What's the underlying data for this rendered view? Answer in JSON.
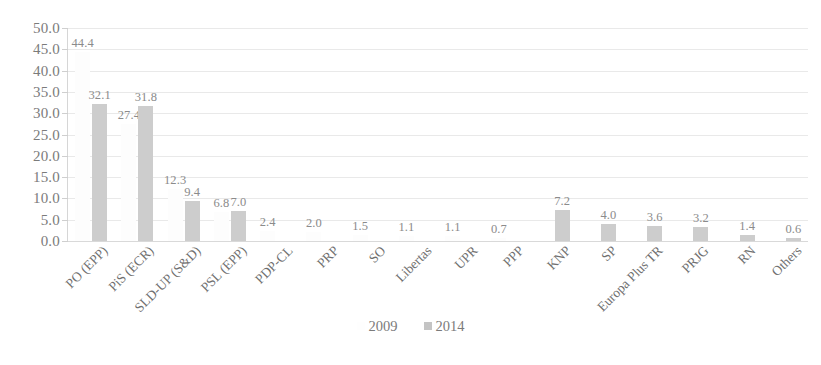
{
  "chart_data": {
    "type": "bar",
    "title": "",
    "subtitle": "",
    "xlabel": "",
    "ylabel": "",
    "ylim": [
      0.0,
      50.0
    ],
    "ytick_step": 5.0,
    "ytick_labels": [
      "50.0",
      "45.0",
      "40.0",
      "35.0",
      "30.0",
      "25.0",
      "20.0",
      "15.0",
      "10.0",
      "5.0",
      "0.0"
    ],
    "grid": true,
    "legend_position": "bottom",
    "categories": [
      "PO (EPP)",
      "PiS (ECR)",
      "SLD-UP (S&D)",
      "PSL (EPP)",
      "PDP-CL",
      "PRP",
      "SO",
      "Libertas",
      "UPR",
      "PPP",
      "KNP",
      "SP",
      "Europa Plus TR",
      "PRJG",
      "RN",
      "Others"
    ],
    "series": [
      {
        "name": "2009",
        "color": "#fdfdfd",
        "values": [
          44.4,
          27.4,
          12.3,
          6.8,
          2.4,
          2.0,
          1.5,
          1.1,
          1.1,
          0.7,
          null,
          null,
          null,
          null,
          null,
          null
        ],
        "labels": [
          "44.4",
          "27.4",
          "12.3",
          "6.8",
          "2.4",
          "2.0",
          "1.5",
          "1.1",
          "1.1",
          "0.7",
          "",
          "",
          "",
          "",
          "",
          ""
        ]
      },
      {
        "name": "2014",
        "color": "#cdcdcd",
        "values": [
          32.1,
          31.8,
          9.4,
          7.0,
          null,
          null,
          null,
          null,
          null,
          null,
          7.2,
          4.0,
          3.6,
          3.2,
          1.4,
          0.6
        ],
        "labels": [
          "32.1",
          "31.8",
          "9.4",
          "7.0",
          "",
          "",
          "",
          "",
          "",
          "",
          "7.2",
          "4.0",
          "3.6",
          "3.2",
          "1.4",
          "0.6"
        ]
      }
    ]
  },
  "legend": {
    "items": [
      {
        "label": "2009",
        "swatch_icon": "square-swatch-2009"
      },
      {
        "label": "2014",
        "swatch_icon": "square-swatch-2014"
      }
    ]
  }
}
